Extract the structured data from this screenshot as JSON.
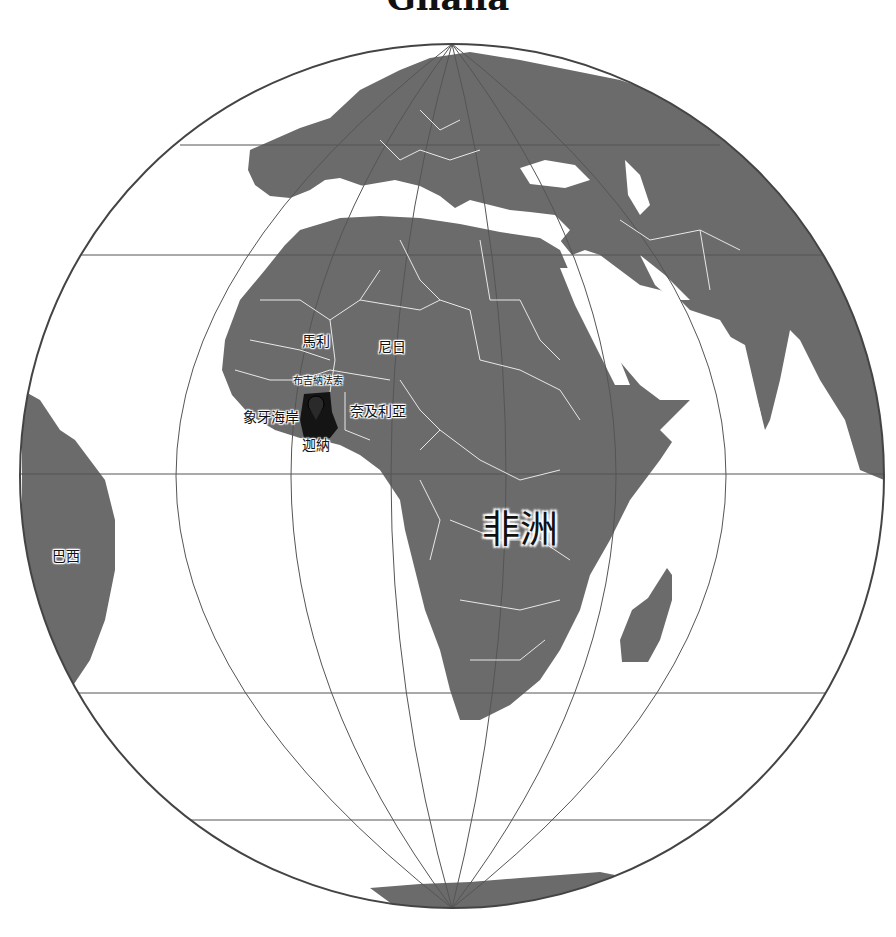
{
  "map": {
    "title": "Ghana",
    "projection": "orthographic",
    "colors": {
      "ocean": "#ffffff",
      "land": "#6b6b6b",
      "border": "#e8e8e8",
      "highlight": "#141414",
      "graticule": "#555555"
    },
    "highlighted_country": "迦納",
    "labels": {
      "continent": "非洲",
      "brazil": "巴西",
      "mali": "馬利",
      "niger": "尼日",
      "burkina_faso": "布吉納法索",
      "ivory_coast": "象牙海岸",
      "nigeria": "奈及利亞",
      "ghana": "迦納"
    },
    "marker": "location-pin-icon"
  }
}
